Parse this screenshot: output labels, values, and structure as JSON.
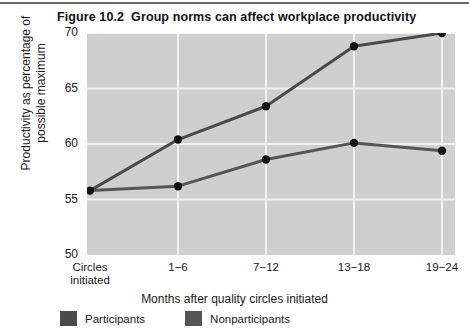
{
  "figure": {
    "number": "Figure 10.2",
    "title": "Group norms can affect workplace productivity"
  },
  "colors": {
    "plot_background": "#cfcfcf",
    "gridline": "#f2f2f2",
    "series_participants": "#4a4a4a",
    "series_nonparticipants": "#555555",
    "marker": "#111111",
    "text": "#1a1a1a",
    "top_rule": "#6b6b6b"
  },
  "legend": {
    "position": "bottom-left",
    "items": [
      {
        "label": "Participants",
        "color": "#4a4a4a"
      },
      {
        "label": "Nonparticipants",
        "color": "#555555"
      }
    ]
  },
  "chart_data": {
    "type": "line",
    "xlabel": "Months after quality circles initiated",
    "ylabel": "Productivity as percentage of possible maximum",
    "categories": [
      "Circles initiated",
      "1−6",
      "7−12",
      "13−18",
      "19−24"
    ],
    "category_lines": [
      [
        "Circles",
        "initiated"
      ],
      [
        "1−6"
      ],
      [
        "7−12"
      ],
      [
        "13−18"
      ],
      [
        "19−24"
      ]
    ],
    "ylim": [
      50,
      70
    ],
    "yticks": [
      50,
      55,
      60,
      65,
      70
    ],
    "ytick_labels": [
      "50",
      "55",
      "60",
      "65",
      "70"
    ],
    "grid": "horizontal-and-vertical",
    "series": [
      {
        "name": "Participants",
        "color": "#4a4a4a",
        "values": [
          55.8,
          60.4,
          63.4,
          68.8,
          70.0
        ]
      },
      {
        "name": "Nonparticipants",
        "color": "#555555",
        "values": [
          55.8,
          56.2,
          58.6,
          60.1,
          59.4
        ]
      }
    ]
  }
}
